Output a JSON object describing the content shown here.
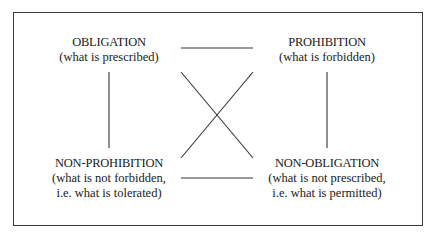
{
  "diagram": {
    "type": "square-of-opposition",
    "nodes": {
      "top_left": {
        "title": "OBLIGATION",
        "desc_line1": "(what is prescribed)",
        "desc_line2": ""
      },
      "top_right": {
        "title": "PROHIBITION",
        "desc_line1": "(what is forbidden)",
        "desc_line2": ""
      },
      "bottom_left": {
        "title": "NON-PROHIBITION",
        "desc_line1": "(what is not forbidden,",
        "desc_line2": "i.e. what is tolerated)"
      },
      "bottom_right": {
        "title": "NON-OBLIGATION",
        "desc_line1": "(what is not prescribed,",
        "desc_line2": "i.e. what is permitted)"
      }
    },
    "edges": [
      {
        "from": "top_left",
        "to": "top_right",
        "kind": "horizontal-top"
      },
      {
        "from": "bottom_left",
        "to": "bottom_right",
        "kind": "horizontal-bottom"
      },
      {
        "from": "top_left",
        "to": "bottom_left",
        "kind": "vertical-left"
      },
      {
        "from": "top_right",
        "to": "bottom_right",
        "kind": "vertical-right"
      },
      {
        "from": "top_left",
        "to": "bottom_right",
        "kind": "diagonal"
      },
      {
        "from": "top_right",
        "to": "bottom_left",
        "kind": "diagonal"
      }
    ],
    "colors": {
      "line": "#333333",
      "text": "#1a1a1a",
      "background": "#ffffff"
    }
  }
}
